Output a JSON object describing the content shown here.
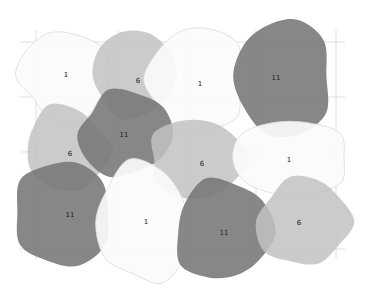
{
  "diagram": {
    "type": "overlapping-blob-grid",
    "rows": 3,
    "cols": 4,
    "palette": {
      "1": {
        "fill": "#fbfbfb",
        "stroke": "#d9d9d9",
        "opacity": 0.92
      },
      "6": {
        "fill": "#c2c2c2",
        "stroke": "none",
        "opacity": 0.85
      },
      "11": {
        "fill": "#767676",
        "stroke": "none",
        "opacity": 0.88
      }
    },
    "blobs": [
      {
        "label": "1",
        "cx": 65,
        "cy": 76,
        "rx": 46,
        "ry": 44,
        "seed": 1
      },
      {
        "label": "6",
        "cx": 135,
        "cy": 75,
        "rx": 45,
        "ry": 46,
        "seed": 2
      },
      {
        "label": "1",
        "cx": 196,
        "cy": 80,
        "rx": 48,
        "ry": 56,
        "seed": 3
      },
      {
        "label": "11",
        "cx": 283,
        "cy": 76,
        "rx": 52,
        "ry": 62,
        "seed": 4
      },
      {
        "label": "6",
        "cx": 65,
        "cy": 148,
        "rx": 45,
        "ry": 42,
        "seed": 5
      },
      {
        "label": "11",
        "cx": 124,
        "cy": 135,
        "rx": 48,
        "ry": 46,
        "seed": 6
      },
      {
        "label": "6",
        "cx": 198,
        "cy": 160,
        "rx": 52,
        "ry": 42,
        "seed": 7
      },
      {
        "label": "1",
        "cx": 290,
        "cy": 158,
        "rx": 58,
        "ry": 40,
        "seed": 8
      },
      {
        "label": "11",
        "cx": 62,
        "cy": 212,
        "rx": 52,
        "ry": 56,
        "seed": 9
      },
      {
        "label": "1",
        "cx": 146,
        "cy": 222,
        "rx": 50,
        "ry": 60,
        "seed": 10
      },
      {
        "label": "11",
        "cx": 222,
        "cy": 232,
        "rx": 50,
        "ry": 54,
        "seed": 11
      },
      {
        "label": "6",
        "cx": 305,
        "cy": 222,
        "rx": 48,
        "ry": 48,
        "seed": 12
      }
    ],
    "labels": [
      {
        "text": "1",
        "x": 66,
        "y": 75
      },
      {
        "text": "6",
        "x": 138,
        "y": 81
      },
      {
        "text": "1",
        "x": 200,
        "y": 84
      },
      {
        "text": "11",
        "x": 276,
        "y": 78
      },
      {
        "text": "6",
        "x": 70,
        "y": 154
      },
      {
        "text": "11",
        "x": 124,
        "y": 135
      },
      {
        "text": "6",
        "x": 202,
        "y": 164
      },
      {
        "text": "1",
        "x": 289,
        "y": 160
      },
      {
        "text": "11",
        "x": 70,
        "y": 215
      },
      {
        "text": "1",
        "x": 146,
        "y": 222
      },
      {
        "text": "11",
        "x": 224,
        "y": 233
      },
      {
        "text": "6",
        "x": 299,
        "y": 223
      }
    ],
    "gridlines": {
      "horizontal": [
        42,
        97,
        152,
        249
      ],
      "vertical": [
        36,
        118,
        186,
        256,
        336
      ]
    }
  }
}
